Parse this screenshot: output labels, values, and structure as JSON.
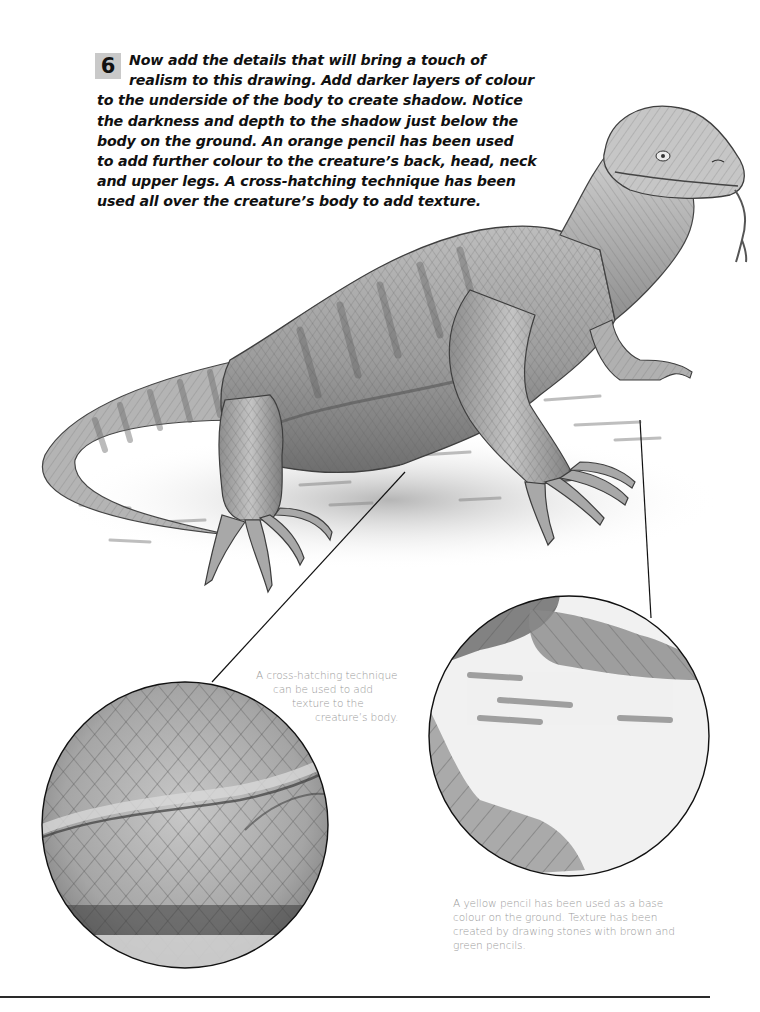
{
  "step": {
    "number": "6",
    "text_lines": [
      "Now add the details that will bring a touch of",
      "realism to this drawing. Add darker layers of colour",
      "to the underside of the body to create shadow. Notice",
      "the darkness and depth to the shadow just below the",
      "body on the ground. An orange pencil has been used",
      "to add further colour to the creature’s back, head, neck",
      "and upper legs. A cross-hatching technique has been",
      "used all over the creature’s body to add texture."
    ]
  },
  "illustration": {
    "subject": "lizard-pencil-drawing",
    "detail_circles": [
      {
        "name": "cross-hatching-detail",
        "focus": "body texture"
      },
      {
        "name": "ground-detail",
        "focus": "ground and foot"
      }
    ]
  },
  "callouts": {
    "cross_hatching": {
      "lines": [
        "A cross-hatching technique",
        "can be used to add",
        "texture to the",
        "creature’s body."
      ]
    },
    "ground": {
      "lines": [
        "A yellow pencil has been used as a base",
        "colour on the ground. Texture has been",
        "created by drawing stones with brown and",
        "green pencils."
      ]
    }
  },
  "colors": {
    "badge_bg": "#c9c9c9",
    "text": "#111111",
    "caption": "#9a9a9a",
    "rule": "#2a2a2a"
  }
}
